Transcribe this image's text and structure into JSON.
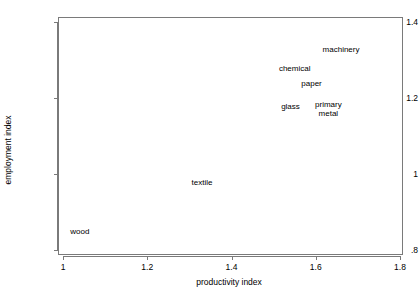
{
  "chart_data": {
    "type": "scatter",
    "title": "",
    "xlabel": "productivity index",
    "ylabel": "employment index",
    "xlim": [
      0.9881,
      1.8
    ],
    "ylim": [
      0.8,
      1.4
    ],
    "xticks": [
      "1",
      "1.2",
      "1.4",
      "1.6",
      "1.8"
    ],
    "xtick_values": [
      1,
      1.2,
      1.4,
      1.6,
      1.8
    ],
    "yticks": [
      "1.4",
      "1.2",
      "1",
      ".8"
    ],
    "ytick_values": [
      1.4,
      1.2,
      1.0,
      0.8
    ],
    "grid": false,
    "legend": "none",
    "marker_style": "text-label-only",
    "points": [
      {
        "label": "wood",
        "x": 1.04,
        "y": 0.85,
        "lines": [
          "wood"
        ]
      },
      {
        "label": "textile",
        "x": 1.33,
        "y": 0.98,
        "lines": [
          "textile"
        ]
      },
      {
        "label": "glass",
        "x": 1.54,
        "y": 1.18,
        "lines": [
          "glass"
        ]
      },
      {
        "label": "primary metal",
        "x": 1.63,
        "y": 1.17,
        "lines": [
          "primary",
          "metal"
        ]
      },
      {
        "label": "paper",
        "x": 1.59,
        "y": 1.24,
        "lines": [
          "paper"
        ]
      },
      {
        "label": "chemical",
        "x": 1.55,
        "y": 1.28,
        "lines": [
          "chemical"
        ]
      },
      {
        "label": "machinery",
        "x": 1.66,
        "y": 1.33,
        "lines": [
          "machinery"
        ]
      }
    ]
  },
  "axes": {
    "x_title": "productivity index",
    "y_title": "employment index",
    "frame_color": "#7a7a7a"
  },
  "labels": {
    "wood": "wood",
    "textile": "textile",
    "glass": "glass",
    "primary": "primary",
    "metal": "metal",
    "paper": "paper",
    "chemical": "chemical",
    "machinery": "machinery"
  }
}
